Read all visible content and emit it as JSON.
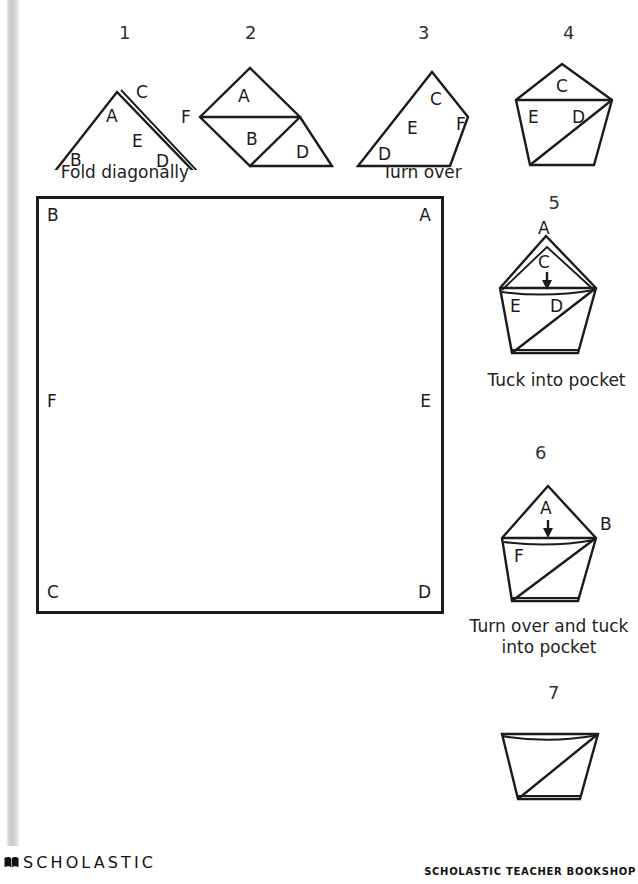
{
  "document": {
    "title": "Origami Fortune Teller Folding Instructions"
  },
  "steps": [
    {
      "number": "1",
      "caption": "Fold diagonally",
      "labels": [
        "A",
        "C",
        "E",
        "B",
        "D"
      ],
      "shape": "triangle-folded"
    },
    {
      "number": "2",
      "caption": "",
      "labels": [
        "A",
        "F",
        "B",
        "D"
      ],
      "shape": "diamond-with-flap"
    },
    {
      "number": "3",
      "caption": "Turn over",
      "labels": [
        "C",
        "E",
        "F",
        "D"
      ],
      "shape": "quadrilateral"
    },
    {
      "number": "4",
      "caption": "",
      "labels": [
        "C",
        "E",
        "D"
      ],
      "shape": "pentagon"
    },
    {
      "number": "5",
      "caption": "Tuck into pocket",
      "labels": [
        "A",
        "C",
        "E",
        "D"
      ],
      "shape": "pentagon-arrow",
      "arrow": "down-arrow"
    },
    {
      "number": "6",
      "caption": "Turn over and tuck into pocket",
      "labels": [
        "A",
        "B",
        "F"
      ],
      "shape": "pentagon-arrow",
      "arrow": "down-arrow"
    },
    {
      "number": "7",
      "caption": "",
      "labels": [],
      "shape": "cup-trapezoid"
    }
  ],
  "worksheet_square": {
    "corners": {
      "top_left": "B",
      "top_right": "A",
      "mid_left": "F",
      "mid_right": "E",
      "bottom_left": "C",
      "bottom_right": "D"
    }
  },
  "footer": {
    "logo_text": "SCHOLASTIC",
    "logo_mark": "open-book-icon",
    "right_text": "SCHOLASTIC TEACHER BOOKSHOP"
  },
  "colors": {
    "ink": "#1b1b1b",
    "paper": "#ffffff",
    "scan_strip": "#d2d2d2"
  }
}
